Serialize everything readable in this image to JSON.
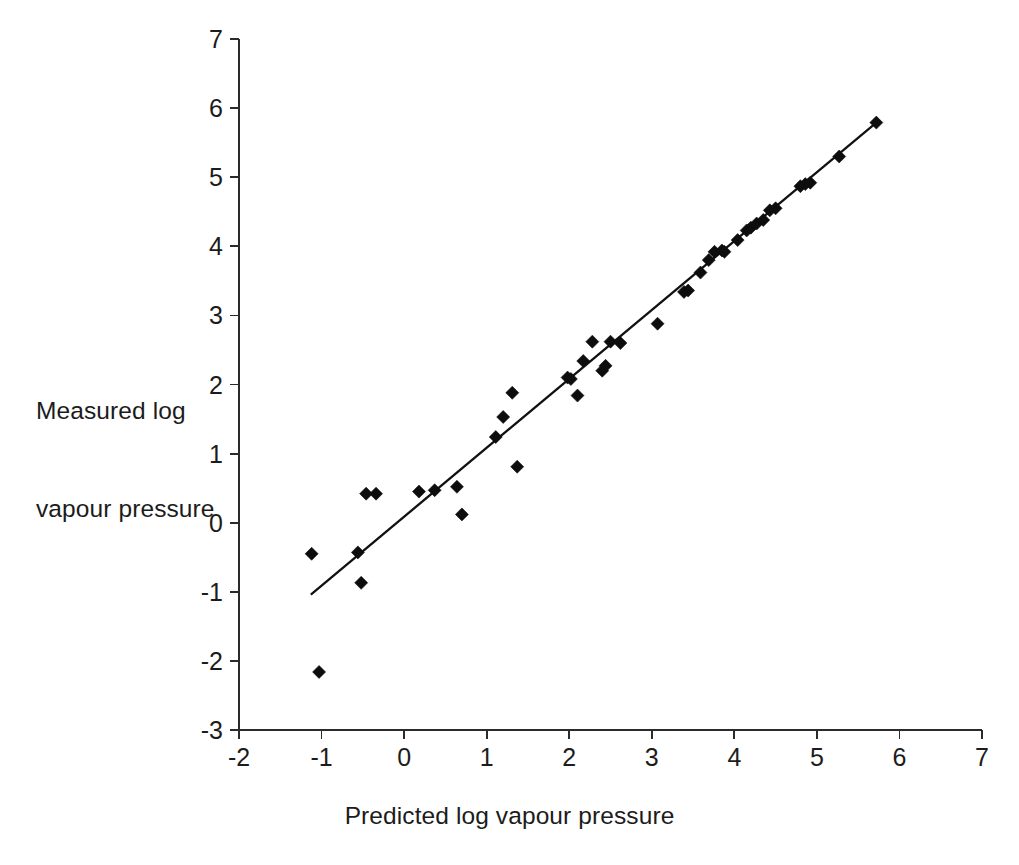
{
  "chart_data": {
    "type": "scatter",
    "title": "",
    "xlabel": "Predicted log vapour pressure",
    "ylabel_line1": "Measured log",
    "ylabel_line2": "vapour pressure",
    "ylabel": "Measured log vapour pressure",
    "xlim": [
      -2,
      7
    ],
    "ylim": [
      -3,
      7
    ],
    "xticks": [
      -2,
      -1,
      0,
      1,
      2,
      3,
      4,
      5,
      6,
      7
    ],
    "yticks": [
      -3,
      -2,
      -1,
      0,
      1,
      2,
      3,
      4,
      5,
      6,
      7
    ],
    "xtick_labels": [
      "-2",
      "-1",
      "0",
      "1",
      "2",
      "3",
      "4",
      "5",
      "6",
      "7"
    ],
    "ytick_labels": [
      "-3",
      "-2",
      "-1",
      "0",
      "1",
      "2",
      "3",
      "4",
      "5",
      "6",
      "7"
    ],
    "grid": false,
    "legend": false,
    "marker": "diamond",
    "marker_color": "#0d0d0d",
    "marker_size": 13,
    "series": [
      {
        "name": "Measured vs predicted log vapour pressure",
        "points": [
          [
            -1.12,
            -0.45
          ],
          [
            -1.03,
            -2.16
          ],
          [
            -0.56,
            -0.43
          ],
          [
            -0.52,
            -0.87
          ],
          [
            -0.46,
            0.42
          ],
          [
            -0.34,
            0.42
          ],
          [
            0.18,
            0.45
          ],
          [
            0.37,
            0.47
          ],
          [
            0.64,
            0.52
          ],
          [
            0.7,
            0.12
          ],
          [
            1.11,
            1.24
          ],
          [
            1.2,
            1.53
          ],
          [
            1.31,
            1.88
          ],
          [
            1.37,
            0.81
          ],
          [
            1.98,
            2.1
          ],
          [
            2.02,
            2.08
          ],
          [
            2.1,
            1.84
          ],
          [
            2.17,
            2.34
          ],
          [
            2.28,
            2.62
          ],
          [
            2.4,
            2.2
          ],
          [
            2.44,
            2.27
          ],
          [
            2.5,
            2.62
          ],
          [
            2.62,
            2.6
          ],
          [
            3.07,
            2.88
          ],
          [
            3.39,
            3.34
          ],
          [
            3.44,
            3.36
          ],
          [
            3.59,
            3.62
          ],
          [
            3.69,
            3.8
          ],
          [
            3.76,
            3.92
          ],
          [
            3.85,
            3.94
          ],
          [
            3.88,
            3.92
          ],
          [
            4.04,
            4.09
          ],
          [
            4.15,
            4.23
          ],
          [
            4.2,
            4.27
          ],
          [
            4.27,
            4.33
          ],
          [
            4.35,
            4.38
          ],
          [
            4.43,
            4.52
          ],
          [
            4.5,
            4.55
          ],
          [
            4.8,
            4.87
          ],
          [
            4.86,
            4.9
          ],
          [
            4.92,
            4.92
          ],
          [
            5.27,
            5.3
          ],
          [
            5.72,
            5.79
          ]
        ]
      }
    ],
    "trendline": {
      "name": "best-fit line",
      "x_start": -1.13,
      "y_start": -1.04,
      "x_end": 5.72,
      "y_end": 5.79
    }
  }
}
